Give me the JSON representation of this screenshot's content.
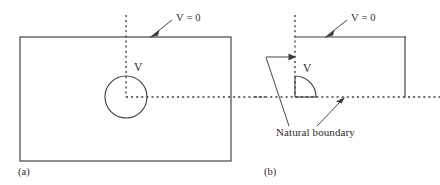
{
  "figure": {
    "type": "technical-diagram",
    "background_color": "#ffffff",
    "line_color": "#3b3b3b",
    "text_color": "#2b2b2b"
  },
  "panels": [
    {
      "id": "a",
      "caption": "(a)",
      "annotations": {
        "grounded_boundary_label": "V = 0",
        "conductor_label": "V"
      },
      "geometry": {
        "boundary_rect": {
          "x": 20,
          "y": 37,
          "width": 211,
          "height": 124,
          "style": "solid"
        },
        "vertical_symmetry_line": {
          "x": 126,
          "y1": 15,
          "y2": 97,
          "style": "dotted"
        },
        "horizontal_symmetry_line": {
          "y": 97,
          "x1": 126,
          "x2": 265,
          "style": "dotted"
        },
        "inner_circle": {
          "cx": 126,
          "cy": 97,
          "r": 21,
          "style": "solid"
        }
      }
    },
    {
      "id": "b",
      "caption": "(b)",
      "annotations": {
        "grounded_boundary_label": "V = 0",
        "conductor_label": "V",
        "natural_boundary_label": "Natural boundary"
      },
      "geometry": {
        "vertical_symmetry_line": {
          "x": 295,
          "y1": 15,
          "y2": 97,
          "style": "dotted"
        },
        "top_boundary": {
          "y": 37,
          "x1": 295,
          "x2": 405,
          "style": "solid"
        },
        "right_boundary": {
          "x": 405,
          "y1": 37,
          "y2": 97,
          "style": "solid"
        },
        "horizontal_symmetry_line": {
          "y": 97,
          "x1": 255,
          "x2": 440,
          "style": "dotted"
        },
        "quarter_arc": {
          "cx": 295,
          "cy": 97,
          "r": 21,
          "style": "solid",
          "quadrant": "upper-right"
        }
      }
    }
  ],
  "legend_text": {
    "v_equals_zero": "V = 0",
    "v": "V",
    "natural_boundary": "Natural boundary",
    "panel_a": "(a)",
    "panel_b": "(b)"
  }
}
